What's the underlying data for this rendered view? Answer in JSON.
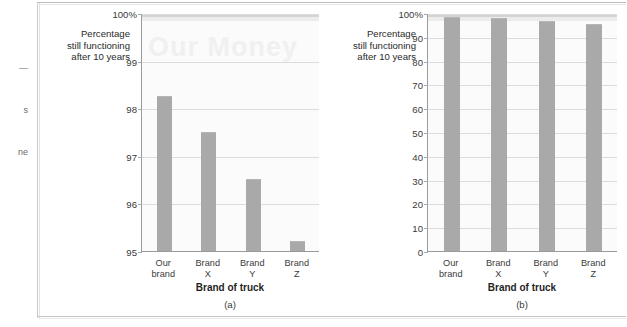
{
  "page": {
    "margin_scraps": [
      {
        "text": "—",
        "top": 63
      },
      {
        "text": "s",
        "top": 105
      },
      {
        "text": "ne",
        "top": 147
      }
    ]
  },
  "figures": [
    {
      "id": "a",
      "caption": "(a)",
      "watermark": "Our Money",
      "y_axis_label": "Percentage\nstill functioning\nafter 10 years",
      "x_axis_title": "Brand of truck"
    },
    {
      "id": "b",
      "caption": "(b)",
      "watermark": "",
      "y_axis_label": "Percentage\nstill functioning\nafter 10 years",
      "x_axis_title": "Brand of truck"
    }
  ],
  "chart_data": [
    {
      "type": "bar",
      "id": "a",
      "title": "(a)",
      "xlabel": "Brand of truck",
      "ylabel": "Percentage still functioning after 10 years",
      "categories": [
        "Our\nbrand",
        "Brand\nX",
        "Brand\nY",
        "Brand\nZ"
      ],
      "category_labels_flat": [
        "Our brand",
        "Brand X",
        "Brand Y",
        "Brand Z"
      ],
      "values": [
        98.25,
        97.5,
        96.5,
        95.2
      ],
      "ylim": [
        95,
        100
      ],
      "ytick_values": [
        95,
        96,
        97,
        98,
        99,
        100
      ],
      "ytick_labels": [
        "95",
        "96",
        "97",
        "98",
        "99",
        "100%"
      ],
      "grid": true,
      "legend": "none",
      "bar_color": "#a9a9a9",
      "plot_background": "#fbfbfb"
    },
    {
      "type": "bar",
      "id": "b",
      "title": "(b)",
      "xlabel": "Brand of truck",
      "ylabel": "Percentage still functioning after 10 years",
      "categories": [
        "Our\nbrand",
        "Brand\nX",
        "Brand\nY",
        "Brand\nZ"
      ],
      "category_labels_flat": [
        "Our brand",
        "Brand X",
        "Brand Y",
        "Brand Z"
      ],
      "values": [
        98.25,
        97.5,
        96.5,
        95.2
      ],
      "ylim": [
        0,
        100
      ],
      "ytick_values": [
        0,
        10,
        20,
        30,
        40,
        50,
        60,
        70,
        80,
        90,
        100
      ],
      "ytick_labels": [
        "0",
        "10",
        "20",
        "30",
        "40",
        "50",
        "60",
        "70",
        "80",
        "90",
        "100%"
      ],
      "grid": true,
      "legend": "none",
      "bar_color": "#a9a9a9",
      "plot_background": "#fbfbfb"
    }
  ],
  "colors": {
    "bar": "#a9a9a9",
    "gridline": "#dcdcdc",
    "axis": "#9a9a9a",
    "plot_bg": "#fbfbfb",
    "page_bg": "#ffffff",
    "frame": "#c9c9c9",
    "text": "#3a3a3a"
  }
}
